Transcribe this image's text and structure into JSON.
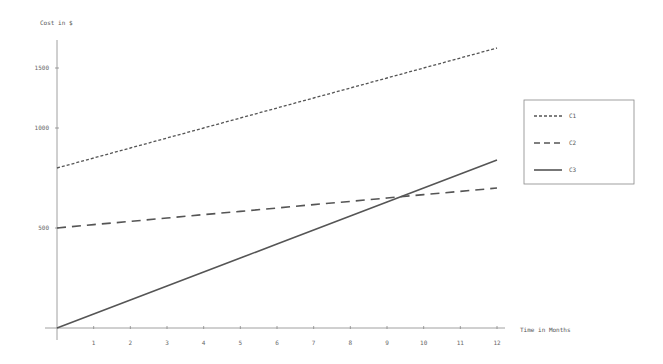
{
  "chart_data": {
    "type": "line",
    "title": "",
    "xlabel": "Time in Months",
    "ylabel": "Cost in $",
    "x": [
      0,
      1,
      2,
      3,
      4,
      5,
      6,
      7,
      8,
      9,
      10,
      11,
      12
    ],
    "x_tick_labels": [
      "1",
      "2",
      "3",
      "4",
      "5",
      "6",
      "7",
      "8",
      "9",
      "10",
      "11",
      "12"
    ],
    "y_tick_labels": [
      {
        "label": "1500",
        "y_px": 68
      },
      {
        "label": "1000",
        "y_px": 128
      },
      {
        "label": "500",
        "y_px": 228
      }
    ],
    "series": [
      {
        "name": "C1",
        "style": "dotted-dash",
        "values": [
          800,
          850,
          900,
          950,
          1000,
          1050,
          1100,
          1150,
          1200,
          1250,
          1300,
          1350,
          1400
        ]
      },
      {
        "name": "C2",
        "style": "long-dash",
        "values": [
          500,
          517,
          533,
          550,
          567,
          583,
          600,
          617,
          633,
          650,
          667,
          683,
          700
        ]
      },
      {
        "name": "C3",
        "style": "solid",
        "values": [
          0,
          70,
          140,
          210,
          280,
          350,
          420,
          490,
          560,
          630,
          700,
          770,
          840
        ]
      }
    ],
    "ylim": [
      0,
      1500
    ],
    "xlim": [
      0,
      12
    ],
    "grid": false,
    "legend_position": "right"
  },
  "colors": {
    "line": "#555555",
    "axis": "#888888"
  }
}
